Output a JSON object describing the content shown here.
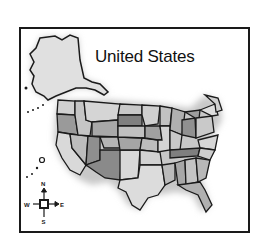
{
  "map": {
    "title": "United States",
    "style": "grayscale clip-art illustration",
    "regions": [
      "Alaska",
      "Hawaii",
      "Contiguous United States"
    ],
    "compass": {
      "north": "N",
      "south": "S",
      "east": "E",
      "west": "W"
    },
    "colors": {
      "border": "#1a1a1a",
      "light_state": "#d9d9d9",
      "mid_state": "#b3b3b3",
      "dark_state": "#8a8a8a",
      "shadow": "#c8c8c8",
      "background": "#ffffff"
    }
  }
}
